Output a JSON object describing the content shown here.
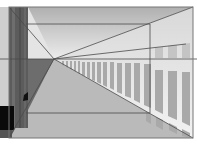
{
  "figure": {
    "type": "one-point-perspective-corridor",
    "width": 197,
    "height": 144,
    "vanishing_point": {
      "x": 54,
      "y": 59
    },
    "horizon_y": 59,
    "frame": {
      "x1": 9,
      "y1": 7,
      "x2": 193,
      "y2": 138
    },
    "inner_frame": {
      "x1": 26,
      "y1": 24,
      "x2": 150,
      "y2": 113
    },
    "colors": {
      "background": "#ffffff",
      "ceiling_top": "#b4b4b4",
      "ceiling_bottom": "#e6e6e6",
      "floor": "#b9b9b9",
      "left_wall_dark": "#5a5a5a",
      "left_wall_mid": "#6e6e6e",
      "left_strip": "#c8c8c8",
      "left_shadow": "#707070",
      "black_block": "#0a0a0a",
      "window_pane": "#a8a8a8",
      "mullion": "#ffffff",
      "line": "#555555"
    }
  }
}
